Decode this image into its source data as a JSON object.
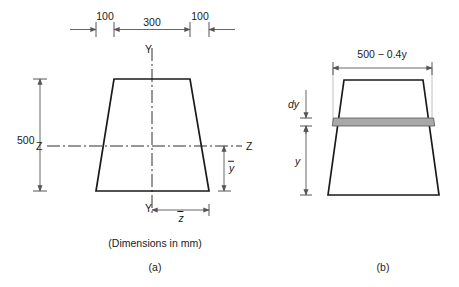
{
  "figure": {
    "caption_units": "(Dimensions in mm)",
    "panel_a_label": "(a)",
    "panel_b_label": "(b)",
    "ink_color": "#1a1a1a",
    "dim_color": "#555555",
    "strip_fill": "#a8a8a8",
    "background": "#ffffff"
  },
  "panel_a": {
    "name": "(a)",
    "top_dims": [
      {
        "label": "100"
      },
      {
        "label": "300"
      },
      {
        "label": "100"
      }
    ],
    "height_dim": {
      "label": "500"
    },
    "axes": {
      "vertical_top_label": "Y",
      "vertical_bottom_label": "Y",
      "horizontal_left_label": "Z",
      "horizontal_right_label": "Z"
    },
    "centroid_dims": {
      "vertical": "y",
      "horizontal": "z"
    },
    "units_note": "(Dimensions in mm)"
  },
  "panel_b": {
    "name": "(b)",
    "width_expression": "500 − 0.4y",
    "strip_thickness_label": "dy",
    "height_from_base_label": "y"
  },
  "geometry": {
    "trapezoid_a": {
      "top_left": 114,
      "top_right": 190,
      "bottom_left": 96,
      "bottom_right": 209,
      "top_y": 79,
      "bottom_y": 191
    },
    "trapezoid_b": {
      "top_left": 344,
      "top_right": 423,
      "bottom_left": 328,
      "bottom_right": 439,
      "top_y": 80,
      "bottom_y": 195
    },
    "strip": {
      "top_y": 118,
      "bottom_y": 126
    },
    "z_axis_y": 146
  }
}
